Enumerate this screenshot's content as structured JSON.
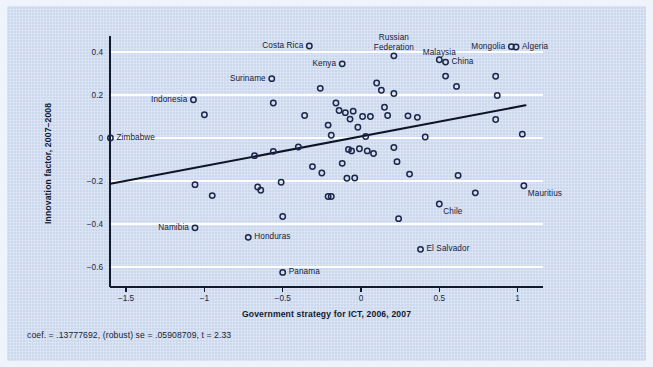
{
  "figure": {
    "background_color": "#ccd8ee",
    "outer_color": "#eff3fb",
    "caption": "coef. = .13777692, (robust) se = .05908709, t = 2.33"
  },
  "chart_data": {
    "type": "scatter",
    "title": "",
    "subtitle": "",
    "xlabel": "Government strategy for ICT, 2006, 2007",
    "ylabel": "Innovation factor, 2007–2008",
    "xlim": [
      -1.62,
      1.12
    ],
    "ylim": [
      -0.66,
      0.47
    ],
    "xticks": [
      -1.5,
      -1,
      -0.5,
      0,
      0.5,
      1
    ],
    "xtick_labels": [
      "−1.5",
      "−1",
      "−0.5",
      "0",
      "0.5",
      "1"
    ],
    "yticks": [
      0.4,
      0.2,
      0,
      -0.2,
      -0.4,
      -0.6
    ],
    "ytick_labels": [
      "0.4",
      "0.2",
      "0",
      "−0.2",
      "−0.4",
      "−0.6"
    ],
    "grid": "horizontal-white",
    "legend": "none",
    "marker": "open-circle",
    "marker_color": "#1b2748",
    "fit_line": {
      "label": "linear fit",
      "coef": 0.13777692,
      "robust_se": 0.05908709,
      "t": 2.33,
      "x_start": -1.6,
      "y_start": -0.213,
      "x_end": 1.05,
      "y_end": 0.152
    },
    "points": [
      {
        "x": -1.6,
        "y": 0.0,
        "label": "Zimbabwe",
        "label_pos": "right"
      },
      {
        "x": -1.07,
        "y": 0.178,
        "label": "Indonesia",
        "label_pos": "left"
      },
      {
        "x": -1.0,
        "y": 0.108,
        "label": "",
        "label_pos": ""
      },
      {
        "x": -1.06,
        "y": -0.217,
        "label": "",
        "label_pos": ""
      },
      {
        "x": -1.06,
        "y": -0.418,
        "label": "Namibia",
        "label_pos": "left"
      },
      {
        "x": -0.95,
        "y": -0.268,
        "label": "",
        "label_pos": ""
      },
      {
        "x": -0.72,
        "y": -0.462,
        "label": "Honduras",
        "label_pos": "right"
      },
      {
        "x": -0.68,
        "y": -0.082,
        "label": "",
        "label_pos": ""
      },
      {
        "x": -0.66,
        "y": -0.228,
        "label": "",
        "label_pos": ""
      },
      {
        "x": -0.64,
        "y": -0.243,
        "label": "",
        "label_pos": ""
      },
      {
        "x": -0.57,
        "y": 0.276,
        "label": "Suriname",
        "label_pos": "left"
      },
      {
        "x": -0.56,
        "y": 0.163,
        "label": "",
        "label_pos": ""
      },
      {
        "x": -0.56,
        "y": -0.062,
        "label": "",
        "label_pos": ""
      },
      {
        "x": -0.51,
        "y": -0.206,
        "label": "",
        "label_pos": ""
      },
      {
        "x": -0.5,
        "y": -0.365,
        "label": "",
        "label_pos": ""
      },
      {
        "x": -0.5,
        "y": -0.625,
        "label": "Panama",
        "label_pos": "right"
      },
      {
        "x": -0.4,
        "y": -0.042,
        "label": "",
        "label_pos": ""
      },
      {
        "x": -0.36,
        "y": 0.105,
        "label": "",
        "label_pos": ""
      },
      {
        "x": -0.33,
        "y": 0.428,
        "label": "Costa Rica",
        "label_pos": "left"
      },
      {
        "x": -0.31,
        "y": -0.133,
        "label": "",
        "label_pos": ""
      },
      {
        "x": -0.26,
        "y": 0.231,
        "label": "",
        "label_pos": ""
      },
      {
        "x": -0.25,
        "y": -0.163,
        "label": "",
        "label_pos": ""
      },
      {
        "x": -0.21,
        "y": 0.06,
        "label": "",
        "label_pos": ""
      },
      {
        "x": -0.21,
        "y": -0.272,
        "label": "",
        "label_pos": ""
      },
      {
        "x": -0.19,
        "y": -0.272,
        "label": "",
        "label_pos": ""
      },
      {
        "x": -0.19,
        "y": 0.013,
        "label": "",
        "label_pos": ""
      },
      {
        "x": -0.16,
        "y": 0.163,
        "label": "",
        "label_pos": ""
      },
      {
        "x": -0.14,
        "y": 0.128,
        "label": "",
        "label_pos": ""
      },
      {
        "x": -0.12,
        "y": 0.345,
        "label": "Kenya",
        "label_pos": "left"
      },
      {
        "x": -0.12,
        "y": -0.118,
        "label": "",
        "label_pos": ""
      },
      {
        "x": -0.1,
        "y": 0.118,
        "label": "",
        "label_pos": ""
      },
      {
        "x": -0.09,
        "y": -0.187,
        "label": "",
        "label_pos": ""
      },
      {
        "x": -0.08,
        "y": -0.053,
        "label": "",
        "label_pos": ""
      },
      {
        "x": -0.07,
        "y": 0.088,
        "label": "",
        "label_pos": ""
      },
      {
        "x": -0.06,
        "y": -0.06,
        "label": "",
        "label_pos": ""
      },
      {
        "x": -0.05,
        "y": 0.125,
        "label": "",
        "label_pos": ""
      },
      {
        "x": -0.04,
        "y": -0.186,
        "label": "",
        "label_pos": ""
      },
      {
        "x": -0.02,
        "y": 0.05,
        "label": "",
        "label_pos": ""
      },
      {
        "x": -0.01,
        "y": -0.05,
        "label": "",
        "label_pos": ""
      },
      {
        "x": 0.01,
        "y": 0.1,
        "label": "",
        "label_pos": ""
      },
      {
        "x": 0.03,
        "y": 0.007,
        "label": "",
        "label_pos": ""
      },
      {
        "x": 0.04,
        "y": -0.06,
        "label": "",
        "label_pos": ""
      },
      {
        "x": 0.06,
        "y": 0.1,
        "label": "",
        "label_pos": ""
      },
      {
        "x": 0.08,
        "y": -0.072,
        "label": "",
        "label_pos": ""
      },
      {
        "x": 0.1,
        "y": 0.256,
        "label": "",
        "label_pos": ""
      },
      {
        "x": 0.13,
        "y": 0.222,
        "label": "",
        "label_pos": ""
      },
      {
        "x": 0.15,
        "y": 0.143,
        "label": "",
        "label_pos": ""
      },
      {
        "x": 0.17,
        "y": 0.105,
        "label": "",
        "label_pos": ""
      },
      {
        "x": 0.21,
        "y": 0.382,
        "label": "Russian Federation",
        "label_pos": "above"
      },
      {
        "x": 0.21,
        "y": 0.207,
        "label": "",
        "label_pos": ""
      },
      {
        "x": 0.21,
        "y": -0.044,
        "label": "",
        "label_pos": ""
      },
      {
        "x": 0.23,
        "y": -0.11,
        "label": "",
        "label_pos": ""
      },
      {
        "x": 0.24,
        "y": -0.375,
        "label": "",
        "label_pos": ""
      },
      {
        "x": 0.3,
        "y": 0.103,
        "label": "",
        "label_pos": ""
      },
      {
        "x": 0.31,
        "y": -0.168,
        "label": "",
        "label_pos": ""
      },
      {
        "x": 0.36,
        "y": 0.096,
        "label": "",
        "label_pos": ""
      },
      {
        "x": 0.38,
        "y": -0.518,
        "label": "El Salvador",
        "label_pos": "right"
      },
      {
        "x": 0.41,
        "y": 0.005,
        "label": "",
        "label_pos": ""
      },
      {
        "x": 0.5,
        "y": 0.364,
        "label": "Malaysia",
        "label_pos": "above"
      },
      {
        "x": 0.5,
        "y": -0.307,
        "label": "Chile",
        "label_pos": "below"
      },
      {
        "x": 0.54,
        "y": 0.353,
        "label": "China",
        "label_pos": "right"
      },
      {
        "x": 0.54,
        "y": 0.288,
        "label": "",
        "label_pos": ""
      },
      {
        "x": 0.61,
        "y": 0.24,
        "label": "",
        "label_pos": ""
      },
      {
        "x": 0.62,
        "y": -0.174,
        "label": "",
        "label_pos": ""
      },
      {
        "x": 0.73,
        "y": -0.255,
        "label": "",
        "label_pos": ""
      },
      {
        "x": 0.86,
        "y": 0.287,
        "label": "",
        "label_pos": ""
      },
      {
        "x": 0.87,
        "y": 0.198,
        "label": "",
        "label_pos": ""
      },
      {
        "x": 0.86,
        "y": 0.086,
        "label": "",
        "label_pos": ""
      },
      {
        "x": 0.96,
        "y": 0.425,
        "label": "Mongolia",
        "label_pos": "left"
      },
      {
        "x": 0.99,
        "y": 0.423,
        "label": "Algeria",
        "label_pos": "right"
      },
      {
        "x": 1.03,
        "y": 0.018,
        "label": "",
        "label_pos": ""
      },
      {
        "x": 1.04,
        "y": -0.222,
        "label": "Mauritius",
        "label_pos": "below"
      }
    ]
  }
}
